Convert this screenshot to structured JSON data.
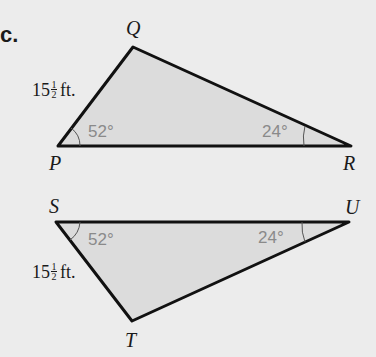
{
  "part_label": "c.",
  "triangles": [
    {
      "name": "PQR",
      "vertices": {
        "P": {
          "label": "P",
          "x": 58,
          "y": 146
        },
        "Q": {
          "label": "Q",
          "x": 133,
          "y": 47
        },
        "R": {
          "label": "R",
          "x": 351,
          "y": 146
        }
      },
      "side_length": {
        "whole": "15",
        "num": "1",
        "den": "2",
        "unit": "ft."
      },
      "angles": {
        "at_P": "52°",
        "at_R": "24°"
      }
    },
    {
      "name": "STU",
      "vertices": {
        "S": {
          "label": "S",
          "x": 56,
          "y": 222
        },
        "T": {
          "label": "T",
          "x": 132,
          "y": 321
        },
        "U": {
          "label": "U",
          "x": 349,
          "y": 222
        }
      },
      "side_length": {
        "whole": "15",
        "num": "1",
        "den": "2",
        "unit": "ft."
      },
      "angles": {
        "at_S": "52°",
        "at_U": "24°"
      }
    }
  ],
  "colors": {
    "background": "#ececec",
    "fill": "#dcdcdc",
    "stroke": "#111111",
    "angle_text": "#8a8a8a"
  }
}
